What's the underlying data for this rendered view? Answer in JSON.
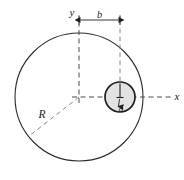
{
  "figure": {
    "background_color": "#ffffff",
    "stroke_color": "#2b2b2b",
    "dash_color": "#5a5a5a",
    "hole_fill_color": "#e2e2e2",
    "labels": {
      "x_axis": "x",
      "y_axis": "y",
      "offset_b": "b",
      "big_radius_R": "R",
      "small_radius_a": "a"
    },
    "geometry": {
      "big_circle": {
        "cx": 79,
        "cy": 97,
        "r": 64
      },
      "small_circle": {
        "cx": 120,
        "cy": 97,
        "r": 15
      },
      "b_dimension": {
        "y": 20,
        "x_start": 79,
        "x_end": 120
      },
      "R_line_angle_deg": 218,
      "a_line": {
        "x": 120,
        "y_start": 97,
        "y_end": 82
      }
    }
  }
}
